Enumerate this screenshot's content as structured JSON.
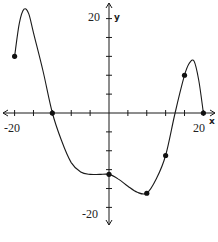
{
  "chart_data": {
    "type": "line",
    "title": "",
    "xlabel": "x",
    "ylabel": "y",
    "xlim": [
      -20,
      20
    ],
    "ylim": [
      -20,
      20
    ],
    "x_tick_step": 4,
    "y_tick_step": 4,
    "tick_labels": {
      "x_min": "-20",
      "x_max": "20",
      "y_max": "20",
      "y_min": "-20"
    },
    "grid": false,
    "legend": null,
    "curve": [
      {
        "x": -20,
        "y": 12
      },
      {
        "x": -19,
        "y": 19
      },
      {
        "x": -18,
        "y": 22
      },
      {
        "x": -17,
        "y": 21
      },
      {
        "x": -16,
        "y": 17
      },
      {
        "x": -14,
        "y": 9
      },
      {
        "x": -12,
        "y": 0
      },
      {
        "x": -10,
        "y": -6
      },
      {
        "x": -8,
        "y": -10.5
      },
      {
        "x": -6,
        "y": -12.5
      },
      {
        "x": -4,
        "y": -13
      },
      {
        "x": -2,
        "y": -13
      },
      {
        "x": 0,
        "y": -13
      },
      {
        "x": 2,
        "y": -14
      },
      {
        "x": 4,
        "y": -15.5
      },
      {
        "x": 6,
        "y": -16.8
      },
      {
        "x": 8,
        "y": -17
      },
      {
        "x": 10,
        "y": -14
      },
      {
        "x": 12,
        "y": -9
      },
      {
        "x": 14,
        "y": 0
      },
      {
        "x": 16,
        "y": 8
      },
      {
        "x": 17,
        "y": 10.5
      },
      {
        "x": 18,
        "y": 11
      },
      {
        "x": 19,
        "y": 7
      },
      {
        "x": 20,
        "y": 0
      }
    ],
    "marked_points": [
      {
        "x": -20,
        "y": 12
      },
      {
        "x": -12,
        "y": 0
      },
      {
        "x": 0,
        "y": -13
      },
      {
        "x": 8,
        "y": -17
      },
      {
        "x": 12,
        "y": -9
      },
      {
        "x": 16,
        "y": 8
      },
      {
        "x": 20,
        "y": 0
      }
    ]
  }
}
